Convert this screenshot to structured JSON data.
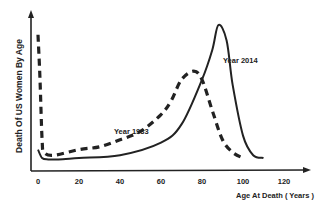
{
  "chart_data": {
    "type": "line",
    "title": "",
    "xlabel": "Age At Death ( Years )",
    "ylabel": "Death Of US Women By Age",
    "xlim": [
      0,
      130
    ],
    "ylim": [
      0,
      100
    ],
    "x_ticks": [
      0,
      20,
      40,
      60,
      80,
      100,
      120
    ],
    "y_ticks": [],
    "grid": false,
    "legend": "inline annotations",
    "series": [
      {
        "name": "Year 1933",
        "style": "dashed",
        "color": "#222222",
        "x": [
          0,
          1,
          2,
          3,
          8,
          20,
          30,
          40,
          50,
          60,
          65,
          70,
          76,
          80,
          85,
          90,
          95,
          100
        ],
        "values": [
          93,
          61,
          18,
          9,
          7,
          11,
          13,
          18,
          24,
          36,
          46,
          61,
          67,
          61,
          39,
          18,
          9,
          5
        ]
      },
      {
        "name": "Year 2014",
        "style": "solid",
        "color": "#222222",
        "x": [
          0,
          2,
          5,
          10,
          20,
          40,
          60,
          70,
          80,
          85,
          88,
          92,
          95,
          100,
          105,
          110
        ],
        "values": [
          11,
          5,
          4,
          4,
          5,
          7,
          16,
          29,
          61,
          82,
          100,
          89,
          57,
          21,
          7,
          5
        ]
      }
    ],
    "annotations": [
      {
        "text": "Year 1933",
        "x": 56,
        "y": 31
      },
      {
        "text": "Year 2014",
        "x": 91,
        "y": 74
      }
    ]
  },
  "labels": {
    "ylabel": "Death Of US Women By Age",
    "xlabel": "Age At Death ( Years )",
    "ann_1933": "Year 1933",
    "ann_2014": "Year 2014",
    "ticks": [
      "0",
      "20",
      "40",
      "60",
      "80",
      "100",
      "120"
    ]
  }
}
